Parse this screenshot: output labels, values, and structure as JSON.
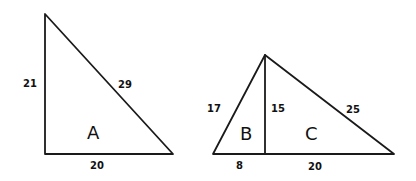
{
  "figures": {
    "triangle_a": {
      "label": "A",
      "sides": {
        "left": "21",
        "hypotenuse": "29",
        "bottom": "20"
      }
    },
    "triangle_bc": {
      "regions": {
        "b": "B",
        "c": "C"
      },
      "sides": {
        "left": "17",
        "altitude": "15",
        "right": "25",
        "bottom_left": "8",
        "bottom_right": "20"
      }
    }
  },
  "colors": {
    "stroke": "#1a1a1a",
    "text": "#111111",
    "background": "#ffffff"
  }
}
